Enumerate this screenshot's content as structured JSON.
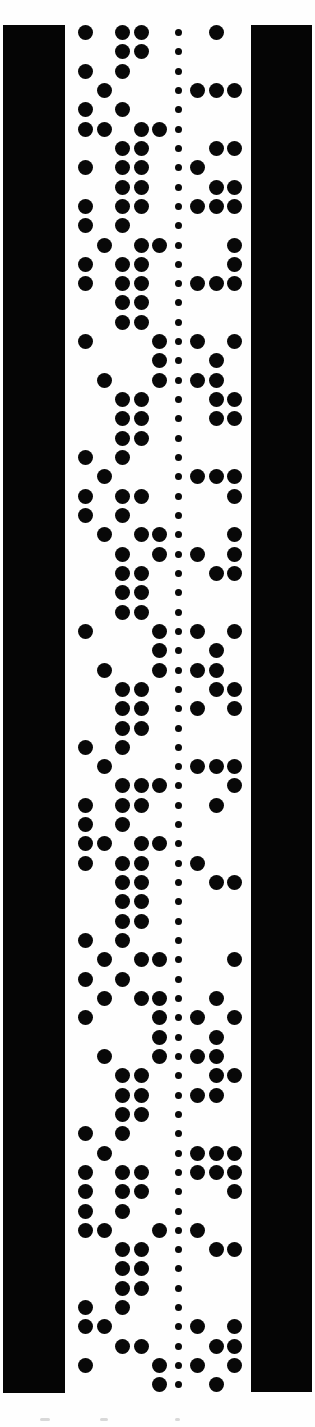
{
  "tape": {
    "colors": {
      "background": "#fefefe",
      "bar": "#050505",
      "hole": "#080808"
    },
    "left_bar": {
      "x": 3,
      "y": 25,
      "w": 62,
      "h": 1368
    },
    "right_bar": {
      "x": 251,
      "y": 25,
      "w": 61,
      "h": 1367
    },
    "column_x": [
      85,
      104,
      122,
      141,
      159,
      197,
      216,
      234
    ],
    "sprocket_x": 178,
    "first_row_y": 32.5,
    "row_pitch": 19.32,
    "rows": [
      "10110010",
      "00110000",
      "10100000",
      "01000111",
      "10100000",
      "11011000",
      "00110011",
      "10110100",
      "00110011",
      "10110111",
      "10100000",
      "01011001",
      "10110001",
      "10110111",
      "00110000",
      "00110000",
      "10001101",
      "00001010",
      "01001110",
      "00110011",
      "00110011",
      "00110000",
      "10100000",
      "01000111",
      "10110001",
      "10100000",
      "01011001",
      "00101101",
      "00110011",
      "00110000",
      "00110000",
      "10001101",
      "00001010",
      "01001110",
      "00110011",
      "00110101",
      "00110000",
      "10100000",
      "01000111",
      "00111001",
      "10110010",
      "10100000",
      "11011000",
      "10110100",
      "00110011",
      "00110000",
      "00110000",
      "10100000",
      "01011001",
      "10100000",
      "01011010",
      "10001101",
      "00001010",
      "01001110",
      "00110011",
      "00110110",
      "00110000",
      "10100000",
      "01000111",
      "10110111",
      "10110001",
      "10100000",
      "11001100",
      "00110011",
      "00110000",
      "00110000",
      "10100000",
      "11000101",
      "00110011",
      "10001101",
      "00001010"
    ]
  }
}
